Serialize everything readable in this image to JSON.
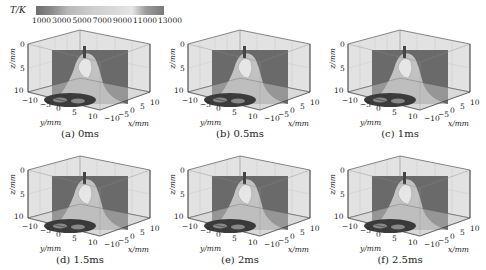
{
  "chart_data": {
    "type": "heatmap",
    "title": "",
    "colorbar": {
      "label": "T/K",
      "ticks": [
        "1000",
        "3000",
        "5000",
        "7000",
        "9000",
        "11000",
        "13000"
      ],
      "range": [
        1000,
        13000
      ]
    },
    "axes": {
      "xlabel": "x/mm",
      "ylabel": "y/mm",
      "zlabel": "z/mm",
      "x_ticks": [
        "−10",
        "−5",
        "0",
        "5",
        "10"
      ],
      "y_ticks": [
        "−10",
        "−5",
        "0",
        "5",
        "10"
      ],
      "z_ticks": [
        "0",
        "5",
        "10"
      ]
    },
    "panels": [
      {
        "id": "a",
        "caption": "(a) 0ms",
        "time_ms": 0
      },
      {
        "id": "b",
        "caption": "(b) 0.5ms",
        "time_ms": 0.5
      },
      {
        "id": "c",
        "caption": "(c) 1ms",
        "time_ms": 1
      },
      {
        "id": "d",
        "caption": "(d) 1.5ms",
        "time_ms": 1.5
      },
      {
        "id": "e",
        "caption": "(e) 2ms",
        "time_ms": 2
      },
      {
        "id": "f",
        "caption": "(f) 2.5ms",
        "time_ms": 2.5
      }
    ],
    "grid": true
  }
}
